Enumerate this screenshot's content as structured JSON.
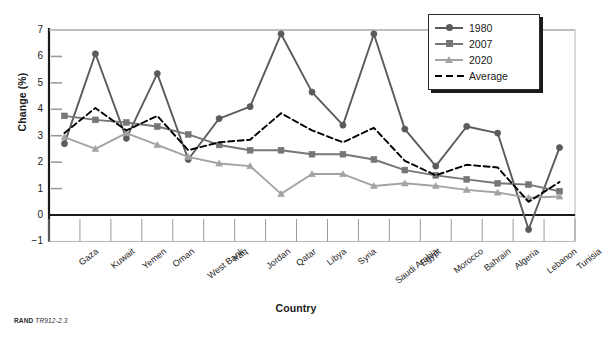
{
  "figure": {
    "source_prefix": "RAND",
    "source_code": "TR912-2.3"
  },
  "legend": {
    "position": "top-right",
    "items": [
      {
        "label": "1980",
        "marker": "circle",
        "color": "#5b5b5b",
        "style": "solid"
      },
      {
        "label": "2007",
        "marker": "square",
        "color": "#767676",
        "style": "solid"
      },
      {
        "label": "2020",
        "marker": "triangle",
        "color": "#a3a3a3",
        "style": "solid"
      },
      {
        "label": "Average",
        "marker": "none",
        "color": "#000000",
        "style": "dashed"
      }
    ]
  },
  "chart_data": {
    "type": "line",
    "title": "",
    "xlabel": "Country",
    "ylabel": "Change (%)",
    "ylim": [
      -1,
      7
    ],
    "yticks": [
      -1,
      0,
      1,
      2,
      3,
      4,
      5,
      6,
      7
    ],
    "grid": false,
    "zero_line": true,
    "legend_position": "top-right",
    "categories": [
      "Gaza",
      "Kuwait",
      "Yemen",
      "Oman",
      "West Bank",
      "Iraq",
      "Jordan",
      "Qatar",
      "Libya",
      "Syria",
      "Saudi Arabia",
      "Egypt",
      "Morocco",
      "Bahrain",
      "Algeria",
      "Lebanon",
      "Tunisia"
    ],
    "series": [
      {
        "name": "1980",
        "color": "#5b5b5b",
        "marker": "circle",
        "style": "solid",
        "values": [
          2.7,
          6.1,
          2.9,
          5.35,
          2.1,
          3.65,
          4.1,
          6.85,
          4.65,
          3.4,
          6.85,
          3.25,
          1.85,
          3.35,
          3.1,
          -0.55,
          2.55
        ]
      },
      {
        "name": "2007",
        "color": "#767676",
        "marker": "square",
        "style": "solid",
        "values": [
          3.75,
          3.6,
          3.5,
          3.35,
          3.05,
          2.65,
          2.45,
          2.45,
          2.3,
          2.3,
          2.1,
          1.7,
          1.5,
          1.35,
          1.2,
          1.15,
          0.9
        ]
      },
      {
        "name": "2020",
        "color": "#a3a3a3",
        "marker": "triangle",
        "style": "solid",
        "values": [
          2.95,
          2.5,
          3.1,
          2.65,
          2.2,
          1.95,
          1.85,
          0.8,
          1.55,
          1.55,
          1.1,
          1.2,
          1.1,
          0.95,
          0.85,
          0.65,
          0.7
        ]
      },
      {
        "name": "Average",
        "color": "#000000",
        "marker": "none",
        "style": "dashed",
        "values": [
          3.1,
          4.05,
          3.2,
          3.75,
          2.45,
          2.75,
          2.85,
          3.85,
          3.2,
          2.75,
          3.3,
          2.05,
          1.5,
          1.9,
          1.8,
          0.5,
          1.25
        ]
      }
    ]
  }
}
